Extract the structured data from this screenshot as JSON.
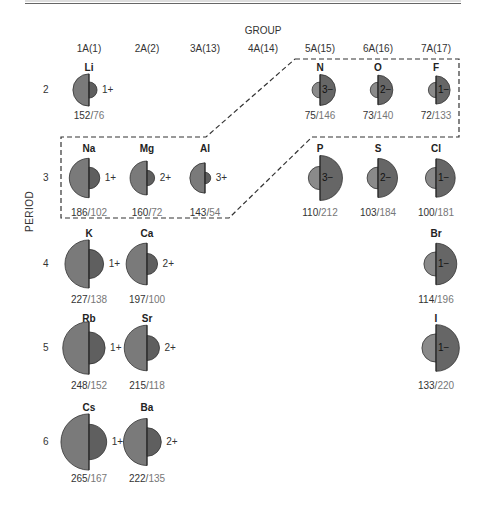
{
  "header": {
    "group_title": "GROUP",
    "groups": [
      {
        "label": "1A(1)",
        "x": 89
      },
      {
        "label": "2A(2)",
        "x": 147
      },
      {
        "label": "3A(13)",
        "x": 205
      },
      {
        "label": "4A(14)",
        "x": 263
      },
      {
        "label": "5A(15)",
        "x": 320
      },
      {
        "label": "6A(16)",
        "x": 378
      },
      {
        "label": "7A(17)",
        "x": 436
      }
    ],
    "period_title": "PERIOD",
    "periods": [
      {
        "label": "2",
        "y": 90
      },
      {
        "label": "3",
        "y": 178
      },
      {
        "label": "4",
        "y": 264
      },
      {
        "label": "5",
        "y": 348
      },
      {
        "label": "6",
        "y": 442
      }
    ]
  },
  "colors": {
    "atom_fill": "#7a7a7a",
    "cation_fill": "#5f5f5f",
    "anion_fill": "#666666",
    "outline": "#333333",
    "dashed_box": "#333333"
  },
  "chart_data": {
    "type": "diagram",
    "xlabel": "GROUP",
    "ylabel": "PERIOD",
    "legend": "value format: atomic radius / ionic radius",
    "elements": [
      {
        "symbol": "Li",
        "group": "1A(1)",
        "period": 2,
        "atomic_radius": 152,
        "ionic_radius": 76,
        "charge": "1+"
      },
      {
        "symbol": "N",
        "group": "5A(15)",
        "period": 2,
        "atomic_radius": 75,
        "ionic_radius": 146,
        "charge": "3−"
      },
      {
        "symbol": "O",
        "group": "6A(16)",
        "period": 2,
        "atomic_radius": 73,
        "ionic_radius": 140,
        "charge": "2−"
      },
      {
        "symbol": "F",
        "group": "7A(17)",
        "period": 2,
        "atomic_radius": 72,
        "ionic_radius": 133,
        "charge": "1−"
      },
      {
        "symbol": "Na",
        "group": "1A(1)",
        "period": 3,
        "atomic_radius": 186,
        "ionic_radius": 102,
        "charge": "1+"
      },
      {
        "symbol": "Mg",
        "group": "2A(2)",
        "period": 3,
        "atomic_radius": 160,
        "ionic_radius": 72,
        "charge": "2+"
      },
      {
        "symbol": "Al",
        "group": "3A(13)",
        "period": 3,
        "atomic_radius": 143,
        "ionic_radius": 54,
        "charge": "3+"
      },
      {
        "symbol": "P",
        "group": "5A(15)",
        "period": 3,
        "atomic_radius": 110,
        "ionic_radius": 212,
        "charge": "3−"
      },
      {
        "symbol": "S",
        "group": "6A(16)",
        "period": 3,
        "atomic_radius": 103,
        "ionic_radius": 184,
        "charge": "2−"
      },
      {
        "symbol": "Cl",
        "group": "7A(17)",
        "period": 3,
        "atomic_radius": 100,
        "ionic_radius": 181,
        "charge": "1−"
      },
      {
        "symbol": "K",
        "group": "1A(1)",
        "period": 4,
        "atomic_radius": 227,
        "ionic_radius": 138,
        "charge": "1+"
      },
      {
        "symbol": "Ca",
        "group": "2A(2)",
        "period": 4,
        "atomic_radius": 197,
        "ionic_radius": 100,
        "charge": "2+"
      },
      {
        "symbol": "Br",
        "group": "7A(17)",
        "period": 4,
        "atomic_radius": 114,
        "ionic_radius": 196,
        "charge": "1−"
      },
      {
        "symbol": "Rb",
        "group": "1A(1)",
        "period": 5,
        "atomic_radius": 248,
        "ionic_radius": 152,
        "charge": "1+"
      },
      {
        "symbol": "Sr",
        "group": "2A(2)",
        "period": 5,
        "atomic_radius": 215,
        "ionic_radius": 118,
        "charge": "2+"
      },
      {
        "symbol": "I",
        "group": "7A(17)",
        "period": 5,
        "atomic_radius": 133,
        "ionic_radius": 220,
        "charge": "1−"
      },
      {
        "symbol": "Cs",
        "group": "1A(1)",
        "period": 6,
        "atomic_radius": 265,
        "ionic_radius": 167,
        "charge": "1+"
      },
      {
        "symbol": "Ba",
        "group": "2A(2)",
        "period": 6,
        "atomic_radius": 222,
        "ionic_radius": 135,
        "charge": "2+"
      }
    ],
    "annotations": [
      "Dashed outline encloses Na, Mg, Al (period 3 metals) and N, O, F, P, S, Cl (nonmetals) forming isoelectronic series"
    ]
  },
  "layout": {
    "scale_px_per_pm": 0.106,
    "rows": {
      "2": {
        "sym_y": 62,
        "cy": 90,
        "val_y": 110
      },
      "3": {
        "sym_y": 143,
        "cy": 178,
        "val_y": 207
      },
      "4": {
        "sym_y": 228,
        "cy": 264,
        "val_y": 294
      },
      "5": {
        "sym_y": 313,
        "cy": 348,
        "val_y": 380
      },
      "6": {
        "sym_y": 402,
        "cy": 442,
        "val_y": 473
      }
    },
    "cols": {
      "1A(1)": 89,
      "2A(2)": 147,
      "3A(13)": 205,
      "4A(14)": 263,
      "5A(15)": 320,
      "6A(16)": 378,
      "7A(17)": 436
    }
  }
}
